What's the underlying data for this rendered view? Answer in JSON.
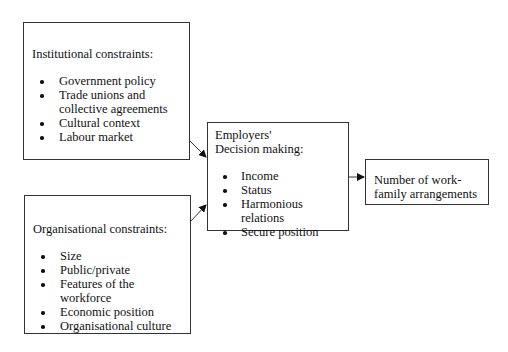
{
  "diagram": {
    "institutional": {
      "title": "Institutional constraints:",
      "items": [
        "Government policy",
        "Trade unions and collective agreements",
        "Cultural context",
        "Labour market"
      ]
    },
    "organisational": {
      "title": "Organisational constraints:",
      "items": [
        "Size",
        "Public/private",
        "Features of the workforce",
        "Economic position",
        "Organisational culture"
      ]
    },
    "employers": {
      "title_line1": "Employers'",
      "title_line2": "Decision making:",
      "items": [
        "Income",
        "Status",
        "Harmonious relations",
        "Secure position"
      ]
    },
    "outcome": {
      "line1": "Number of work-",
      "line2": "family arrangements"
    },
    "colors": {
      "line": "#333333",
      "text": "#111111",
      "background": "#ffffff"
    }
  }
}
